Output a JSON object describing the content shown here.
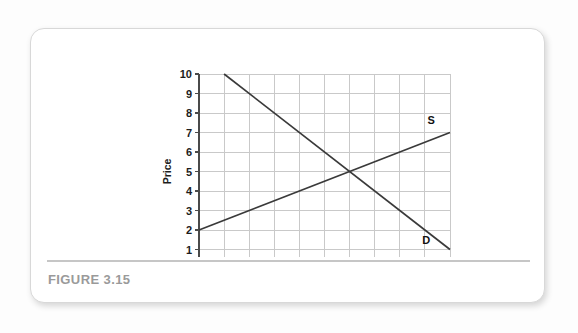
{
  "figure": {
    "caption": "FIGURE 3.15"
  },
  "chart_data": {
    "type": "line",
    "title": "",
    "xlabel": "Quantity of kilos per month",
    "ylabel": "Price",
    "xlim": [
      0,
      1000
    ],
    "ylim": [
      0,
      10
    ],
    "grid": true,
    "legend_position": "inline-end-labels",
    "x_ticks_major": [
      0,
      200,
      400,
      600,
      800,
      1000
    ],
    "x_ticks_minor": [
      100,
      300,
      500,
      700,
      900
    ],
    "x_tick_labels": [
      "0",
      "200",
      "400",
      "600",
      "800",
      "1000"
    ],
    "y_ticks": [
      0,
      1,
      2,
      3,
      4,
      5,
      6,
      7,
      8,
      9,
      10
    ],
    "y_tick_labels": [
      "0",
      "1",
      "2",
      "3",
      "4",
      "5",
      "6",
      "7",
      "8",
      "9",
      "10"
    ],
    "series": [
      {
        "name": "S",
        "label": "S",
        "description": "Supply curve",
        "color": "#3a3a3a",
        "points": [
          [
            0,
            2
          ],
          [
            1000,
            7
          ]
        ],
        "label_at": [
          925,
          7.45
        ]
      },
      {
        "name": "D",
        "label": "D",
        "description": "Demand curve",
        "color": "#3a3a3a",
        "points": [
          [
            100,
            10
          ],
          [
            1000,
            1
          ]
        ],
        "label_at": [
          905,
          1.3
        ]
      }
    ],
    "equilibrium": {
      "x": 600,
      "y": 5
    }
  }
}
